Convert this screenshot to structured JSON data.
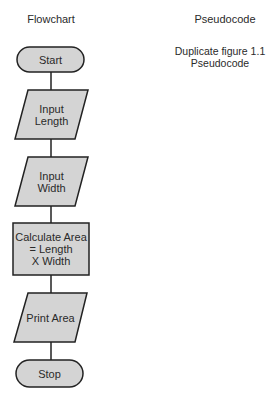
{
  "headings": {
    "flowchart": "Flowchart",
    "pseudocode": "Pseudocode"
  },
  "pseudocode_note": {
    "line1": "Duplicate figure 1.1",
    "line2": "Pseudocode"
  },
  "flowchart": {
    "nodes": [
      {
        "id": "start",
        "type": "terminal",
        "label": "Start"
      },
      {
        "id": "input-length",
        "type": "input-output",
        "line1": "Input",
        "line2": "Length"
      },
      {
        "id": "input-width",
        "type": "input-output",
        "line1": "Input",
        "line2": "Width"
      },
      {
        "id": "calculate-area",
        "type": "process",
        "line1": "Calculate Area",
        "line2": "= Length",
        "line3": "X Width"
      },
      {
        "id": "print-area",
        "type": "input-output",
        "label": "Print Area"
      },
      {
        "id": "stop",
        "type": "terminal",
        "label": "Stop"
      }
    ],
    "colors": {
      "fill": "#d4d4d4",
      "stroke": "#222222"
    }
  }
}
